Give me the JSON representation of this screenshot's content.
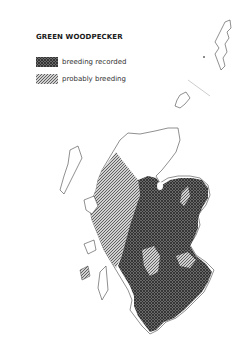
{
  "map": {
    "title": "GREEN WOODPECKER",
    "legend": [
      {
        "key": "recorded",
        "label": "breeding recorded",
        "pattern": "cross-hatch",
        "color": "#555555"
      },
      {
        "key": "probable",
        "label": "probably breeding",
        "pattern": "diagonal-hatch",
        "color": "#888888"
      }
    ],
    "region": "Scotland"
  }
}
